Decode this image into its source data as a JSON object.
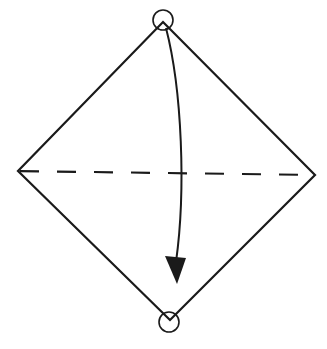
{
  "diagram": {
    "type": "origami-fold-instruction",
    "colors": {
      "background": "#ffffff",
      "stroke": "#1a1a1a"
    },
    "shape": {
      "top": [
        163,
        22
      ],
      "right": [
        315,
        175
      ],
      "bottom": [
        170,
        320
      ],
      "left": [
        18,
        171
      ]
    },
    "fold_line": {
      "style": "dashed",
      "from": [
        18,
        171
      ],
      "to": [
        315,
        175
      ]
    },
    "markers": [
      {
        "name": "top-corner-marker",
        "cx": 163,
        "cy": 20,
        "r": 10
      },
      {
        "name": "bottom-corner-marker",
        "cx": 169,
        "cy": 322,
        "r": 10
      }
    ],
    "arrow": {
      "path": "M 166 28 C 182 90, 186 190, 176 262",
      "head": "165,256 186,258 177,284"
    }
  }
}
